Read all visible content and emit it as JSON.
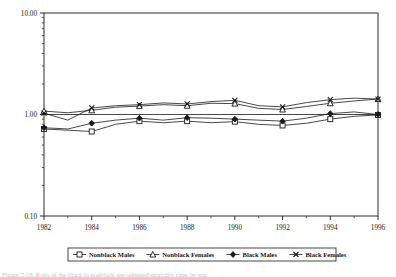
{
  "figure": {
    "caption": "Figure 7-18.  Ratio of the black to nonblack age-adjusted mortality rates by sex."
  },
  "chart_data": {
    "type": "line",
    "title": "",
    "xlabel": "",
    "ylabel": "",
    "xlim": [
      1982,
      1996
    ],
    "ylim": [
      0.1,
      10.0
    ],
    "yscale": "log",
    "grid": false,
    "legend_position": "bottom",
    "y_tick_labels": [
      "10.00",
      "1.00",
      "0.10"
    ],
    "y_tick_values": [
      10.0,
      1.0,
      0.1
    ],
    "x_tick_labels": [
      "1982",
      "1984",
      "1986",
      "1988",
      "1990",
      "1992",
      "1994",
      "1996"
    ],
    "x_tick_values": [
      1982,
      1984,
      1986,
      1988,
      1990,
      1992,
      1994,
      1996
    ],
    "x": [
      1982,
      1983,
      1984,
      1985,
      1986,
      1987,
      1988,
      1989,
      1990,
      1991,
      1992,
      1993,
      1994,
      1995,
      1996
    ],
    "series": [
      {
        "name": "Nonblack Males",
        "marker": "square-open",
        "color": "#1a1a1a",
        "values": [
          0.72,
          0.7,
          0.68,
          0.8,
          0.86,
          0.83,
          0.86,
          0.83,
          0.85,
          0.8,
          0.78,
          0.82,
          0.9,
          0.96,
          0.99
        ]
      },
      {
        "name": "Nonblack Females",
        "marker": "triangle-open",
        "color": "#1a1a1a",
        "values": [
          1.08,
          1.04,
          1.1,
          1.18,
          1.21,
          1.25,
          1.22,
          1.29,
          1.28,
          1.15,
          1.12,
          1.2,
          1.29,
          1.36,
          1.42
        ]
      },
      {
        "name": "Black Males",
        "marker": "diamond-filled",
        "color": "#1a1a1a",
        "values": [
          0.74,
          0.72,
          0.82,
          0.88,
          0.92,
          0.88,
          0.93,
          0.92,
          0.9,
          0.88,
          0.86,
          0.92,
          1.02,
          1.06,
          1.0
        ]
      },
      {
        "name": "Black Females",
        "marker": "x-cross",
        "color": "#1a1a1a",
        "values": [
          1.03,
          0.88,
          1.16,
          1.22,
          1.25,
          1.3,
          1.27,
          1.34,
          1.38,
          1.22,
          1.19,
          1.31,
          1.4,
          1.45,
          1.42
        ]
      }
    ]
  }
}
